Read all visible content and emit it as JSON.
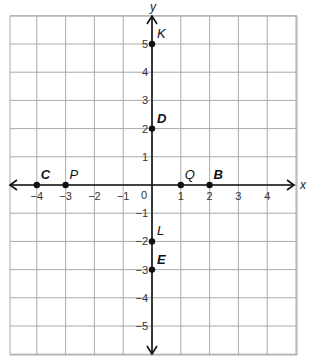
{
  "diagram": {
    "type": "coordinate-plane",
    "axes": {
      "x_label": "x",
      "y_label": "y",
      "origin_label": "0",
      "x_ticks": [
        -4,
        -3,
        -2,
        -1,
        1,
        2,
        3,
        4
      ],
      "y_ticks": [
        5,
        4,
        3,
        2,
        1,
        -1,
        -2,
        -3,
        -4,
        -5
      ],
      "x_range": [
        -5,
        5
      ],
      "y_range": [
        -6,
        6
      ]
    },
    "grid": {
      "on": true,
      "color": "#aaaaaa"
    },
    "points": [
      {
        "label": "K",
        "x": 0,
        "y": 5,
        "bold": false
      },
      {
        "label": "D",
        "x": 0,
        "y": 2,
        "bold": true
      },
      {
        "label": "C",
        "x": -4,
        "y": 0,
        "bold": true
      },
      {
        "label": "P",
        "x": -3,
        "y": 0,
        "bold": false
      },
      {
        "label": "Q",
        "x": 1,
        "y": 0,
        "bold": false
      },
      {
        "label": "B",
        "x": 2,
        "y": 0,
        "bold": true
      },
      {
        "label": "L",
        "x": 0,
        "y": -2,
        "bold": false
      },
      {
        "label": "E",
        "x": 0,
        "y": -3,
        "bold": true
      }
    ]
  }
}
